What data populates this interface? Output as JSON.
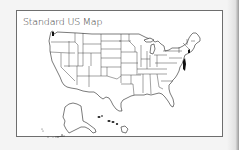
{
  "card": {
    "title": "Standard US Map"
  },
  "map": {
    "region": "United States",
    "insets": [
      "Alaska",
      "Hawaii"
    ],
    "style": "state outlines, black on white",
    "border_color": "#6e6e6e",
    "line_color": "#222222",
    "background": "#ffffff"
  }
}
